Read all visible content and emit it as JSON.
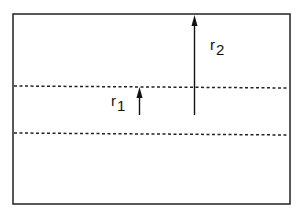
{
  "diagram": {
    "type": "radial-distance-schematic",
    "frame": {
      "x1": 13,
      "y1": 14,
      "x2": 290,
      "y2": 204,
      "stroke": "#222222"
    },
    "dotted_lines": [
      {
        "name": "boundary-1",
        "y": 86
      },
      {
        "name": "boundary-2",
        "y": 133
      }
    ],
    "arrows": [
      {
        "name": "r1",
        "x": 139,
        "from_y": 115,
        "to_y": 87
      },
      {
        "name": "r2",
        "x": 194,
        "from_y": 115,
        "to_y": 15
      }
    ],
    "labels": {
      "r1": {
        "base": "r",
        "sub": "1"
      },
      "r2": {
        "base": "r",
        "sub": "2"
      }
    }
  }
}
